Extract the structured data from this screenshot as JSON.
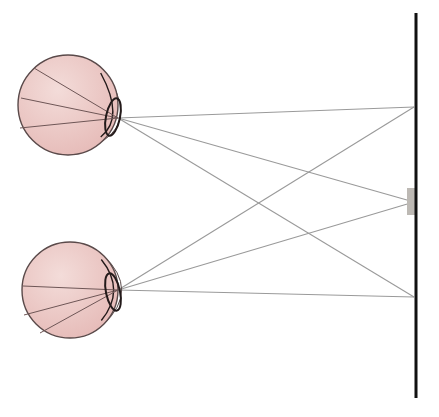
{
  "diagram": {
    "colors": {
      "background": "#ffffff",
      "eyeball_fill": "#e9c2c0",
      "eyeball_fill_light": "#f3dcd9",
      "eyeball_stroke": "#5a4a4a",
      "lens_stroke": "#231a1a",
      "internal_ray": "#6e5656",
      "ray": "#9a9a9a",
      "screen": "#111111",
      "target_block": "#bdb9b4"
    },
    "eyes": [
      {
        "name": "top-eye",
        "center": [
          68,
          105
        ],
        "radius": 50,
        "lens": {
          "cx": 113,
          "cy": 117,
          "rx": 7,
          "ry": 19,
          "rotate": 12
        },
        "cornea_apex": [
          131,
          118
        ],
        "focal_point": [
          118,
          118
        ],
        "retina_points": [
          [
            34,
            68
          ],
          [
            21,
            98
          ],
          [
            20,
            128
          ]
        ]
      },
      {
        "name": "bottom-eye",
        "center": [
          70,
          290
        ],
        "radius": 48,
        "lens": {
          "cx": 113,
          "cy": 292,
          "rx": 7,
          "ry": 19,
          "rotate": -12
        },
        "cornea_apex": [
          132,
          290
        ],
        "focal_point": [
          118,
          290
        ],
        "retina_points": [
          [
            23,
            286
          ],
          [
            24,
            315
          ],
          [
            40,
            333
          ]
        ]
      }
    ],
    "screen": {
      "x": 416,
      "y1": 13,
      "y2": 398,
      "width": 3
    },
    "target_block": {
      "x": 407,
      "y": 188,
      "width": 10,
      "height": 27
    },
    "screen_points": [
      [
        414,
        107
      ],
      [
        414,
        202
      ],
      [
        414,
        297
      ]
    ],
    "rays": [
      {
        "from": "top-eye",
        "to": [
          414,
          107
        ]
      },
      {
        "from": "top-eye",
        "to": [
          414,
          202
        ]
      },
      {
        "from": "top-eye",
        "to": [
          414,
          297
        ]
      },
      {
        "from": "bottom-eye",
        "to": [
          414,
          107
        ]
      },
      {
        "from": "bottom-eye",
        "to": [
          414,
          202
        ]
      },
      {
        "from": "bottom-eye",
        "to": [
          414,
          297
        ]
      }
    ]
  }
}
